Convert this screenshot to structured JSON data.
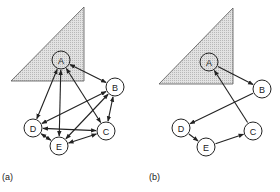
{
  "panels": [
    {
      "id": "a",
      "label": "(a)",
      "label_pos": [
        2,
        180
      ],
      "triangle": [
        [
          84,
          7
        ],
        [
          11,
          81
        ],
        [
          84,
          81
        ]
      ],
      "nodes": [
        {
          "id": "A",
          "label": "A",
          "x": 61,
          "y": 60
        },
        {
          "id": "B",
          "label": "B",
          "x": 115,
          "y": 87
        },
        {
          "id": "C",
          "label": "C",
          "x": 106,
          "y": 131
        },
        {
          "id": "D",
          "label": "D",
          "x": 33,
          "y": 128
        },
        {
          "id": "E",
          "label": "E",
          "x": 59,
          "y": 146
        }
      ],
      "edges": [
        {
          "from": "A",
          "to": "B",
          "bidirectional": true
        },
        {
          "from": "A",
          "to": "D",
          "bidirectional": true
        },
        {
          "from": "A",
          "to": "E",
          "bidirectional": true
        },
        {
          "from": "A",
          "to": "C",
          "bidirectional": true
        },
        {
          "from": "B",
          "to": "D",
          "bidirectional": true
        },
        {
          "from": "B",
          "to": "C",
          "bidirectional": true
        },
        {
          "from": "B",
          "to": "E",
          "bidirectional": true
        },
        {
          "from": "D",
          "to": "C",
          "bidirectional": true
        },
        {
          "from": "D",
          "to": "E",
          "bidirectional": true
        },
        {
          "from": "E",
          "to": "C",
          "bidirectional": true
        }
      ]
    },
    {
      "id": "b",
      "label": "(b)",
      "label_pos": [
        149,
        180
      ],
      "triangle": [
        [
          233,
          8
        ],
        [
          159,
          84
        ],
        [
          233,
          84
        ]
      ],
      "nodes": [
        {
          "id": "A",
          "label": "A",
          "x": 209,
          "y": 62
        },
        {
          "id": "B",
          "label": "B",
          "x": 262,
          "y": 89
        },
        {
          "id": "C",
          "label": "C",
          "x": 253,
          "y": 131
        },
        {
          "id": "D",
          "label": "D",
          "x": 181,
          "y": 128
        },
        {
          "id": "E",
          "label": "E",
          "x": 206,
          "y": 147
        }
      ],
      "edges": [
        {
          "from": "A",
          "to": "B",
          "bidirectional": false
        },
        {
          "from": "B",
          "to": "D",
          "bidirectional": false
        },
        {
          "from": "D",
          "to": "E",
          "bidirectional": false
        },
        {
          "from": "E",
          "to": "C",
          "bidirectional": false
        },
        {
          "from": "C",
          "to": "A",
          "bidirectional": false
        }
      ]
    }
  ],
  "style": {
    "node_radius": 9,
    "stroke": "#222222",
    "triangle_fill": "#d4d4d4",
    "node_fill": "#ffffff"
  }
}
